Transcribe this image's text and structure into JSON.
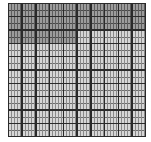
{
  "diagram": {
    "type": "hundred-grid",
    "rows": 10,
    "columns": 10,
    "total_cells": 100,
    "shaded_cells": 25,
    "shaded_rows": [
      {
        "row": 1,
        "shaded_columns": 10
      },
      {
        "row": 2,
        "shaded_columns": 10
      },
      {
        "row": 3,
        "shaded_columns": 5
      }
    ],
    "colors": {
      "shaded": "#9c9c9c",
      "unshaded": "#d6d6d6",
      "grid_line": "#2a2a2a"
    }
  }
}
